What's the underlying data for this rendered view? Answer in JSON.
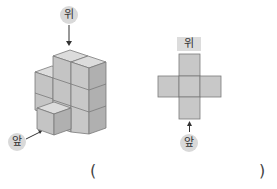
{
  "left_figure": {
    "top_label": "위",
    "front_label": "앞",
    "description": "isometric stack of unit cubes"
  },
  "right_figure": {
    "top_label": "위",
    "front_label": "앞",
    "description": "top view: plus-shaped arrangement of 5 squares"
  },
  "answer": {
    "open_paren": "(",
    "close_paren": ")"
  },
  "colors": {
    "cube_top": "#dcdcdc",
    "cube_left": "#c4c4c4",
    "cube_right": "#b0b0b0",
    "square_fill": "#c8c8c8",
    "edge": "#7a7a7a"
  }
}
